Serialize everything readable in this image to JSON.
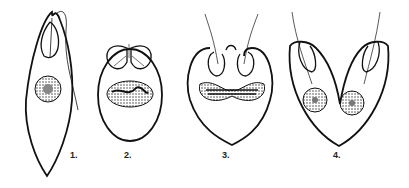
{
  "figure": {
    "labels": [
      "1.",
      "2.",
      "3.",
      "4."
    ],
    "stroke_color": "#111111",
    "background": "#ffffff"
  }
}
